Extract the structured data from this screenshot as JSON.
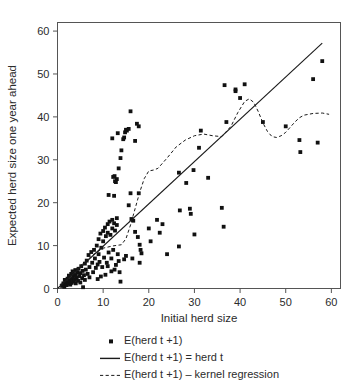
{
  "chart_data": {
    "type": "scatter",
    "title": "",
    "xlabel": "Initial herd size",
    "ylabel": "Expected herd size one year ahead",
    "xlim": [
      0,
      62
    ],
    "ylim": [
      0,
      62
    ],
    "xticks": [
      0,
      10,
      20,
      30,
      40,
      50,
      60
    ],
    "yticks": [
      0,
      10,
      20,
      30,
      40,
      50,
      60
    ],
    "xticklabels": [
      "0",
      "10",
      "20",
      "30",
      "40",
      "50",
      "60"
    ],
    "yticklabels": [
      "0",
      "10",
      "20",
      "30",
      "40",
      "50",
      "60"
    ],
    "grid": false,
    "legend_position": "below-axis",
    "frame": "box",
    "marker": "filled-square",
    "marker_color": "#111111",
    "line_color": "#1a1a1a",
    "series": [
      {
        "name": "E(herd t +1)",
        "type": "scatter",
        "points": [
          [
            1.0,
            0.6
          ],
          [
            1.3,
            1.2
          ],
          [
            1.5,
            0.4
          ],
          [
            1.6,
            2.0
          ],
          [
            1.8,
            1.0
          ],
          [
            2.0,
            1.5
          ],
          [
            2.0,
            0.8
          ],
          [
            2.2,
            2.3
          ],
          [
            2.4,
            1.1
          ],
          [
            2.5,
            3.0
          ],
          [
            2.6,
            1.9
          ],
          [
            2.8,
            0.9
          ],
          [
            3.0,
            3.4
          ],
          [
            3.0,
            2.2
          ],
          [
            3.1,
            1.3
          ],
          [
            3.3,
            4.0
          ],
          [
            3.4,
            2.7
          ],
          [
            3.5,
            1.6
          ],
          [
            3.6,
            3.2
          ],
          [
            3.8,
            2.0
          ],
          [
            3.9,
            4.3
          ],
          [
            4.0,
            3.0
          ],
          [
            4.0,
            1.2
          ],
          [
            4.2,
            2.5
          ],
          [
            4.3,
            3.8
          ],
          [
            4.5,
            1.8
          ],
          [
            4.6,
            4.6
          ],
          [
            4.8,
            2.9
          ],
          [
            5.0,
            3.6
          ],
          [
            5.0,
            1.4
          ],
          [
            5.2,
            5.2
          ],
          [
            5.4,
            2.4
          ],
          [
            5.5,
            4.1
          ],
          [
            5.6,
            0.3
          ],
          [
            5.8,
            3.1
          ],
          [
            6.0,
            5.8
          ],
          [
            6.0,
            2.0
          ],
          [
            6.2,
            4.4
          ],
          [
            6.4,
            6.5
          ],
          [
            6.6,
            3.4
          ],
          [
            6.8,
            7.8
          ],
          [
            7.0,
            5.0
          ],
          [
            7.0,
            2.6
          ],
          [
            7.4,
            8.5
          ],
          [
            7.6,
            6.0
          ],
          [
            7.8,
            3.8
          ],
          [
            8.0,
            9.0
          ],
          [
            8.2,
            7.0
          ],
          [
            8.4,
            4.8
          ],
          [
            8.6,
            10.0
          ],
          [
            8.8,
            5.6
          ],
          [
            9.0,
            11.5
          ],
          [
            9.0,
            8.0
          ],
          [
            9.2,
            6.2
          ],
          [
            9.4,
            12.8
          ],
          [
            9.6,
            9.5
          ],
          [
            9.8,
            5.0
          ],
          [
            10.0,
            13.4
          ],
          [
            10.0,
            11.0
          ],
          [
            10.2,
            7.2
          ],
          [
            10.4,
            14.2
          ],
          [
            10.6,
            12.2
          ],
          [
            10.8,
            6.0
          ],
          [
            11.0,
            15.0
          ],
          [
            11.0,
            13.0
          ],
          [
            11.2,
            8.4
          ],
          [
            11.4,
            15.6
          ],
          [
            11.6,
            12.5
          ],
          [
            11.8,
            7.0
          ],
          [
            12.0,
            16.0
          ],
          [
            12.0,
            14.0
          ],
          [
            12.2,
            9.0
          ],
          [
            12.4,
            15.2
          ],
          [
            12.6,
            13.5
          ],
          [
            12.8,
            5.5
          ],
          [
            13.0,
            16.4
          ],
          [
            13.0,
            14.8
          ],
          [
            13.2,
            8.0
          ],
          [
            13.4,
            6.4
          ],
          [
            13.6,
            3.8
          ],
          [
            13.8,
            1.6
          ],
          [
            12.5,
            4.4
          ],
          [
            11.8,
            4.0
          ],
          [
            11.0,
            5.2
          ],
          [
            10.5,
            3.2
          ],
          [
            9.5,
            2.8
          ],
          [
            8.8,
            2.2
          ],
          [
            13.0,
            25.5
          ],
          [
            12.8,
            24.8
          ],
          [
            12.5,
            26.2
          ],
          [
            12.2,
            26.0
          ],
          [
            12.6,
            25.0
          ],
          [
            13.4,
            28.0
          ],
          [
            13.8,
            30.4
          ],
          [
            14.0,
            32.2
          ],
          [
            12.0,
            35.0
          ],
          [
            13.2,
            36.2
          ],
          [
            14.4,
            34.8
          ],
          [
            14.6,
            35.2
          ],
          [
            14.8,
            36.4
          ],
          [
            15.0,
            37.0
          ],
          [
            15.2,
            36.8
          ],
          [
            15.6,
            37.2
          ],
          [
            16.0,
            41.3
          ],
          [
            17.0,
            34.4
          ],
          [
            17.4,
            38.4
          ],
          [
            17.8,
            37.8
          ],
          [
            11.2,
            21.8
          ],
          [
            12.4,
            21.6
          ],
          [
            16.0,
            22.2
          ],
          [
            17.8,
            22.2
          ],
          [
            15.6,
            19.4
          ],
          [
            16.2,
            16.2
          ],
          [
            16.6,
            15.8
          ],
          [
            17.0,
            13.2
          ],
          [
            17.6,
            12.0
          ],
          [
            18.0,
            10.2
          ],
          [
            18.2,
            9.0
          ],
          [
            18.4,
            8.2
          ],
          [
            18.0,
            6.0
          ],
          [
            16.4,
            7.0
          ],
          [
            15.0,
            7.6
          ],
          [
            14.6,
            6.8
          ],
          [
            20.0,
            14.0
          ],
          [
            20.4,
            11.0
          ],
          [
            21.8,
            16.0
          ],
          [
            22.4,
            13.0
          ],
          [
            23.0,
            15.0
          ],
          [
            24.0,
            8.0
          ],
          [
            26.6,
            9.8
          ],
          [
            26.8,
            18.2
          ],
          [
            29.0,
            18.6
          ],
          [
            29.2,
            17.4
          ],
          [
            30.0,
            12.6
          ],
          [
            36.0,
            18.8
          ],
          [
            36.4,
            14.4
          ],
          [
            29.8,
            27.6
          ],
          [
            31.0,
            32.8
          ],
          [
            33.0,
            25.8
          ],
          [
            28.2,
            24.6
          ],
          [
            26.6,
            27.0
          ],
          [
            31.4,
            36.8
          ],
          [
            37.0,
            38.8
          ],
          [
            41.0,
            47.6
          ],
          [
            39.0,
            46.0
          ],
          [
            39.0,
            46.4
          ],
          [
            40.0,
            44.4
          ],
          [
            36.6,
            47.4
          ],
          [
            45.0,
            38.8
          ],
          [
            50.0,
            37.8
          ],
          [
            53.0,
            34.6
          ],
          [
            53.2,
            31.8
          ],
          [
            57.0,
            34.0
          ],
          [
            56.0,
            48.8
          ],
          [
            58.0,
            53.0
          ]
        ]
      },
      {
        "name": "E(herd t +1) = herd t",
        "type": "line",
        "style": "solid",
        "points": [
          [
            0,
            0
          ],
          [
            58,
            57.2
          ]
        ]
      },
      {
        "name": "E(herd t +1) – kernel regression",
        "type": "line",
        "style": "dashed",
        "points": [
          [
            0.5,
            0.8
          ],
          [
            2,
            2.6
          ],
          [
            4,
            4.4
          ],
          [
            6,
            6.2
          ],
          [
            8,
            8.0
          ],
          [
            10,
            9.4
          ],
          [
            12,
            9.9
          ],
          [
            14,
            10.2
          ],
          [
            15,
            11.6
          ],
          [
            16,
            14.8
          ],
          [
            17,
            18.6
          ],
          [
            18,
            22.4
          ],
          [
            19,
            25.6
          ],
          [
            20,
            27.4
          ],
          [
            21,
            27.6
          ],
          [
            22,
            28.0
          ],
          [
            24,
            30.4
          ],
          [
            26,
            33.0
          ],
          [
            28,
            34.6
          ],
          [
            30,
            35.6
          ],
          [
            32,
            36.0
          ],
          [
            34,
            35.6
          ],
          [
            36,
            35.4
          ],
          [
            38,
            37.8
          ],
          [
            39.5,
            41.0
          ],
          [
            41,
            43.6
          ],
          [
            42,
            44.2
          ],
          [
            43,
            43.4
          ],
          [
            44,
            41.2
          ],
          [
            45,
            38.6
          ],
          [
            46,
            36.6
          ],
          [
            47,
            35.4
          ],
          [
            48,
            35.2
          ],
          [
            49,
            35.6
          ],
          [
            50,
            36.4
          ],
          [
            51,
            37.6
          ],
          [
            52,
            38.8
          ],
          [
            53,
            39.8
          ],
          [
            54,
            40.4
          ],
          [
            56,
            40.8
          ],
          [
            58,
            40.9
          ],
          [
            59.5,
            40.6
          ]
        ]
      }
    ],
    "legend": [
      {
        "marker": "square",
        "label": "E(herd t +1)"
      },
      {
        "marker": "solid-line",
        "label": "E(herd t +1) = herd t"
      },
      {
        "marker": "dashed-line",
        "label": "E(herd t +1) – kernel regression"
      }
    ]
  },
  "colors": {
    "marker": "#111111",
    "axis": "#555555",
    "text": "#2b2b2b",
    "background": "#ffffff"
  }
}
